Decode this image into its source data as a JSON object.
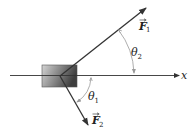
{
  "diagram": {
    "type": "force-vector-diagram",
    "axis": {
      "label": "x"
    },
    "block": {
      "description": "shaded rectangular block"
    },
    "forces": [
      {
        "name": "F",
        "subscript": "1",
        "direction": "up-right"
      },
      {
        "name": "F",
        "subscript": "2",
        "direction": "down-right"
      }
    ],
    "angles": [
      {
        "symbol": "θ",
        "subscript": "2",
        "between": "F1 and x-axis"
      },
      {
        "symbol": "θ",
        "subscript": "1",
        "between": "x-axis and F2"
      }
    ],
    "colors": {
      "line": "#333333",
      "arc": "#999999",
      "block_light": "#d8d8d8",
      "block_dark": "#4a4a4a"
    }
  }
}
